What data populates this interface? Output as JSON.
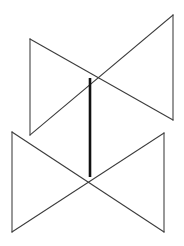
{
  "figure": {
    "background_color": "#ffffff",
    "edge_color": "#3b3b3b",
    "intersection_color": "#111111",
    "canvas": {
      "width": 184,
      "height": 246
    },
    "planes": [
      {
        "name": "upper-plane",
        "label": "Plane A",
        "points": "30,39 173,15 173,120 30,135",
        "left_edge": "30,39 30,135",
        "right_edge": "173,15 173,120",
        "top_edge": "30,39 173,120",
        "bottom_edge": "173,15 30,135"
      },
      {
        "name": "lower-plane",
        "label": "Plane B",
        "points": "12,132 164,133 164,232 12,232",
        "left_edge": "12,132 12,232",
        "right_edge": "164,133 164,232",
        "top_edge": "12,132 164,232",
        "bottom_edge": "164,133 12,232"
      }
    ],
    "intersection": {
      "name": "intersection-segment",
      "label": "Line of intersection",
      "start": "90,78",
      "end": "90,177",
      "path": "M 90 78 L 90 177"
    },
    "vertices": [
      {
        "name": "upper-plane-top-left",
        "x": 30,
        "y": 39
      },
      {
        "name": "upper-plane-top-right",
        "x": 173,
        "y": 15
      },
      {
        "name": "upper-plane-bottom-right",
        "x": 173,
        "y": 120
      },
      {
        "name": "upper-plane-bottom-left",
        "x": 30,
        "y": 135
      },
      {
        "name": "lower-plane-top-left",
        "x": 12,
        "y": 132
      },
      {
        "name": "lower-plane-top-right",
        "x": 164,
        "y": 133
      },
      {
        "name": "lower-plane-bottom-right",
        "x": 164,
        "y": 232
      },
      {
        "name": "lower-plane-bottom-left",
        "x": 12,
        "y": 232
      },
      {
        "name": "upper-crossing-point",
        "x": 90,
        "y": 78
      },
      {
        "name": "lower-crossing-point",
        "x": 90,
        "y": 177
      }
    ]
  }
}
